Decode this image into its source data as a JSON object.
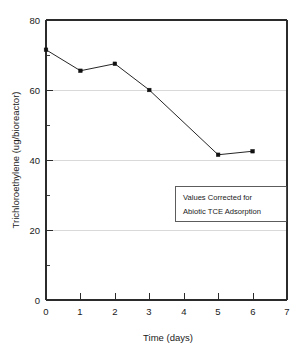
{
  "chart_data": {
    "type": "line",
    "title": "",
    "xlabel": "Time (days)",
    "ylabel": "Trichloroethylene (ug/bioreactor)",
    "x": [
      0,
      1,
      2,
      3,
      5,
      6
    ],
    "values": [
      71.5,
      65.5,
      67.5,
      60.0,
      41.5,
      42.5
    ],
    "series": [
      {
        "name": "Trichloroethylene",
        "x": [
          0,
          1,
          2,
          3,
          5,
          6
        ],
        "values": [
          71.5,
          65.5,
          67.5,
          60.0,
          41.5,
          42.5
        ]
      }
    ],
    "xlim": [
      0,
      7
    ],
    "ylim": [
      0,
      80
    ],
    "xticks": [
      "0",
      "1",
      "2",
      "3",
      "4",
      "5",
      "6",
      "7"
    ],
    "yticks": [
      "0",
      "20",
      "40",
      "60",
      "80"
    ],
    "y_minor_ticks": [
      10,
      30,
      50,
      70
    ],
    "grid": "horizontal-major",
    "legend": "none",
    "marker": "filled-square",
    "line_color": "#262626",
    "marker_color": "#111111",
    "grid_color": "#c9c9c9",
    "annotations": [
      {
        "name": "correction-note",
        "line1": "Values Corrected for",
        "line2": "Abiotic TCE Adsorption"
      }
    ]
  }
}
